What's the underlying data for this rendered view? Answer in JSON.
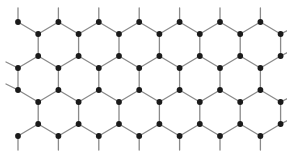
{
  "figure": {
    "name": "honeycomb-lattice-diagram",
    "background_color": "#ffffff",
    "width": 287,
    "height": 159
  },
  "style": {
    "node_color": "#1a1a1a",
    "node_radius": 2.9,
    "bond_color": "#8a8a8a",
    "bond_width": 1.3,
    "stub_color": "#8a8a8a",
    "stub_width": 1.3
  },
  "lattice": {
    "type": "hexagonal-honeycomb",
    "orientation": "armchair-horizontal",
    "hex_columns": 7,
    "hex_rows": 2,
    "horizontal_pitch": 40.4,
    "vertical_pitch": 68,
    "vertical_bond_length": 22,
    "node_count": 56,
    "comment": "Sublattice A columns at x=18,58.4,98.8,139.2,179.6,220,260.4 ; sublattice B columns offset by +20.2"
  },
  "geometry": {
    "columns_a": [
      18,
      58.4,
      98.8,
      139.2,
      179.6,
      220,
      260.4
    ],
    "columns_b": [
      38.2,
      78.6,
      119,
      159.4,
      199.8,
      240.2,
      280.6
    ],
    "rows_a": [
      22,
      68,
      90,
      136
    ],
    "rows_b": [
      34,
      56,
      102,
      124
    ]
  },
  "stubs": {
    "top_up_length": 14,
    "bottom_down_length": 14,
    "side_length": 12,
    "top_row_y": 22,
    "bottom_row_y": 136
  },
  "nodes": [
    {
      "x": 18,
      "y": 22,
      "sub": "A",
      "row": 0
    },
    {
      "x": 58.4,
      "y": 22,
      "sub": "A",
      "row": 0
    },
    {
      "x": 98.8,
      "y": 22,
      "sub": "A",
      "row": 0
    },
    {
      "x": 139.2,
      "y": 22,
      "sub": "A",
      "row": 0
    },
    {
      "x": 179.6,
      "y": 22,
      "sub": "A",
      "row": 0
    },
    {
      "x": 220,
      "y": 22,
      "sub": "A",
      "row": 0
    },
    {
      "x": 260.4,
      "y": 22,
      "sub": "A",
      "row": 0
    },
    {
      "x": 38.2,
      "y": 34,
      "sub": "B",
      "row": 1
    },
    {
      "x": 78.6,
      "y": 34,
      "sub": "B",
      "row": 1
    },
    {
      "x": 119,
      "y": 34,
      "sub": "B",
      "row": 1
    },
    {
      "x": 159.4,
      "y": 34,
      "sub": "B",
      "row": 1
    },
    {
      "x": 199.8,
      "y": 34,
      "sub": "B",
      "row": 1
    },
    {
      "x": 240.2,
      "y": 34,
      "sub": "B",
      "row": 1
    },
    {
      "x": 280.6,
      "y": 34,
      "sub": "B",
      "row": 1
    },
    {
      "x": 38.2,
      "y": 56,
      "sub": "B",
      "row": 2
    },
    {
      "x": 78.6,
      "y": 56,
      "sub": "B",
      "row": 2
    },
    {
      "x": 119,
      "y": 56,
      "sub": "B",
      "row": 2
    },
    {
      "x": 159.4,
      "y": 56,
      "sub": "B",
      "row": 2
    },
    {
      "x": 199.8,
      "y": 56,
      "sub": "B",
      "row": 2
    },
    {
      "x": 240.2,
      "y": 56,
      "sub": "B",
      "row": 2
    },
    {
      "x": 280.6,
      "y": 56,
      "sub": "B",
      "row": 2
    },
    {
      "x": 18,
      "y": 68,
      "sub": "A",
      "row": 3
    },
    {
      "x": 58.4,
      "y": 68,
      "sub": "A",
      "row": 3
    },
    {
      "x": 98.8,
      "y": 68,
      "sub": "A",
      "row": 3
    },
    {
      "x": 139.2,
      "y": 68,
      "sub": "A",
      "row": 3
    },
    {
      "x": 179.6,
      "y": 68,
      "sub": "A",
      "row": 3
    },
    {
      "x": 220,
      "y": 68,
      "sub": "A",
      "row": 3
    },
    {
      "x": 260.4,
      "y": 68,
      "sub": "A",
      "row": 3
    },
    {
      "x": 18,
      "y": 90,
      "sub": "A",
      "row": 4
    },
    {
      "x": 58.4,
      "y": 90,
      "sub": "A",
      "row": 4
    },
    {
      "x": 98.8,
      "y": 90,
      "sub": "A",
      "row": 4
    },
    {
      "x": 139.2,
      "y": 90,
      "sub": "A",
      "row": 4
    },
    {
      "x": 179.6,
      "y": 90,
      "sub": "A",
      "row": 4
    },
    {
      "x": 220,
      "y": 90,
      "sub": "A",
      "row": 4
    },
    {
      "x": 260.4,
      "y": 90,
      "sub": "A",
      "row": 4
    },
    {
      "x": 38.2,
      "y": 102,
      "sub": "B",
      "row": 5
    },
    {
      "x": 78.6,
      "y": 102,
      "sub": "B",
      "row": 5
    },
    {
      "x": 119,
      "y": 102,
      "sub": "B",
      "row": 5
    },
    {
      "x": 159.4,
      "y": 102,
      "sub": "B",
      "row": 5
    },
    {
      "x": 199.8,
      "y": 102,
      "sub": "B",
      "row": 5
    },
    {
      "x": 240.2,
      "y": 102,
      "sub": "B",
      "row": 5
    },
    {
      "x": 280.6,
      "y": 102,
      "sub": "B",
      "row": 5
    },
    {
      "x": 38.2,
      "y": 124,
      "sub": "B",
      "row": 6
    },
    {
      "x": 78.6,
      "y": 124,
      "sub": "B",
      "row": 6
    },
    {
      "x": 119,
      "y": 124,
      "sub": "B",
      "row": 6
    },
    {
      "x": 159.4,
      "y": 124,
      "sub": "B",
      "row": 6
    },
    {
      "x": 199.8,
      "y": 124,
      "sub": "B",
      "row": 6
    },
    {
      "x": 240.2,
      "y": 124,
      "sub": "B",
      "row": 6
    },
    {
      "x": 280.6,
      "y": 124,
      "sub": "B",
      "row": 6
    },
    {
      "x": 18,
      "y": 136,
      "sub": "A",
      "row": 7
    },
    {
      "x": 58.4,
      "y": 136,
      "sub": "A",
      "row": 7
    },
    {
      "x": 98.8,
      "y": 136,
      "sub": "A",
      "row": 7
    },
    {
      "x": 139.2,
      "y": 136,
      "sub": "A",
      "row": 7
    },
    {
      "x": 179.6,
      "y": 136,
      "sub": "A",
      "row": 7
    },
    {
      "x": 220,
      "y": 136,
      "sub": "A",
      "row": 7
    },
    {
      "x": 260.4,
      "y": 136,
      "sub": "A",
      "row": 7
    }
  ]
}
